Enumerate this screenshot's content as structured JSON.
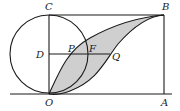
{
  "diagram": {
    "type": "geometry",
    "colors": {
      "stroke": "#1a1a1a",
      "shade": "#cfcfcf",
      "label": "#222222",
      "background": "#ffffff"
    },
    "points": {
      "C": {
        "label": "C",
        "x": 49,
        "y": 15
      },
      "B": {
        "label": "B",
        "x": 164,
        "y": 15
      },
      "O": {
        "label": "O",
        "x": 49,
        "y": 94
      },
      "A": {
        "label": "A",
        "x": 164,
        "y": 94
      },
      "D": {
        "label": "D",
        "x": 49,
        "y": 54
      },
      "P": {
        "label": "P",
        "x": 75,
        "y": 54
      },
      "F": {
        "label": "F",
        "x": 88,
        "y": 54
      },
      "Q": {
        "label": "Q",
        "x": 110,
        "y": 54
      }
    },
    "circle": {
      "center": "D",
      "radius": 39
    },
    "segments": [
      "CB",
      "BA",
      "CO",
      "DQ",
      "baseline"
    ],
    "curves": [
      "O-P-B (upper arc)",
      "O-Q-B (lower arc)"
    ],
    "shaded_region": "between curve OPB and curve OQB"
  }
}
